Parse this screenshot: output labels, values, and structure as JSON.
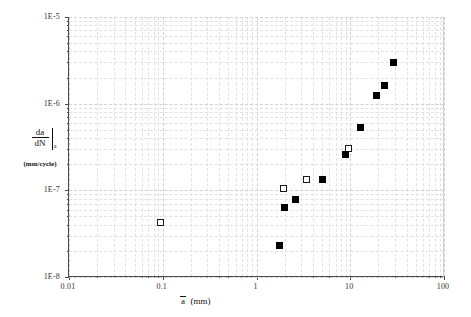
{
  "annotation": {
    "line1": "1-Open Hole, Test: M4",
    "line2": "Alclad 2024-T3",
    "line3": "W = 100 mm, t = 1.6 mm, D = 4.8 mm",
    "line4_prefix": "σ",
    "line4_sub": "max",
    "line4_rest": " = 101.25 MPa, R = 0.386"
  },
  "axes": {
    "x_label_symbol": "a",
    "x_label_units": "(mm)",
    "y_label_num": "da",
    "y_label_den": "dN",
    "y_label_sub": "a",
    "y_label_units": "(mm/cycle)",
    "x_ticks": [
      "0.01",
      "0.1",
      "1",
      "10",
      "100"
    ],
    "y_ticks": [
      "1E-5",
      "1E-6",
      "1E-7",
      "1E-8"
    ],
    "xlim": [
      0.01,
      100
    ],
    "ylim": [
      1e-08,
      1e-05
    ]
  },
  "chart_data": {
    "type": "scatter",
    "title": "",
    "xlabel": "a (mm)",
    "ylabel": "da/dN|a (mm/cycle)",
    "xscale": "log",
    "yscale": "log",
    "xlim": [
      0.01,
      100
    ],
    "ylim": [
      1e-08,
      1e-05
    ],
    "grid": true,
    "legend": "none",
    "series": [
      {
        "name": "open-square",
        "marker": "open square",
        "color": "#ffffff",
        "edge_color": "#1a1a1a",
        "points": [
          {
            "x": 0.095,
            "y": 4.2e-08
          },
          {
            "x": 1.95,
            "y": 1.05e-07
          },
          {
            "x": 3.4,
            "y": 1.35e-07
          },
          {
            "x": 9.5,
            "y": 3e-07
          }
        ]
      },
      {
        "name": "filled-square",
        "marker": "filled square",
        "color": "#000000",
        "edge_color": "#000000",
        "points": [
          {
            "x": 1.75,
            "y": 2.3e-08
          },
          {
            "x": 2.0,
            "y": 6.3e-08
          },
          {
            "x": 2.6,
            "y": 7.8e-08
          },
          {
            "x": 5.0,
            "y": 1.35e-07
          },
          {
            "x": 9.0,
            "y": 2.6e-07
          },
          {
            "x": 13.0,
            "y": 5.3e-07
          },
          {
            "x": 19.0,
            "y": 1.25e-06
          },
          {
            "x": 23.0,
            "y": 1.6e-06
          },
          {
            "x": 29.0,
            "y": 3e-06
          }
        ]
      }
    ]
  }
}
